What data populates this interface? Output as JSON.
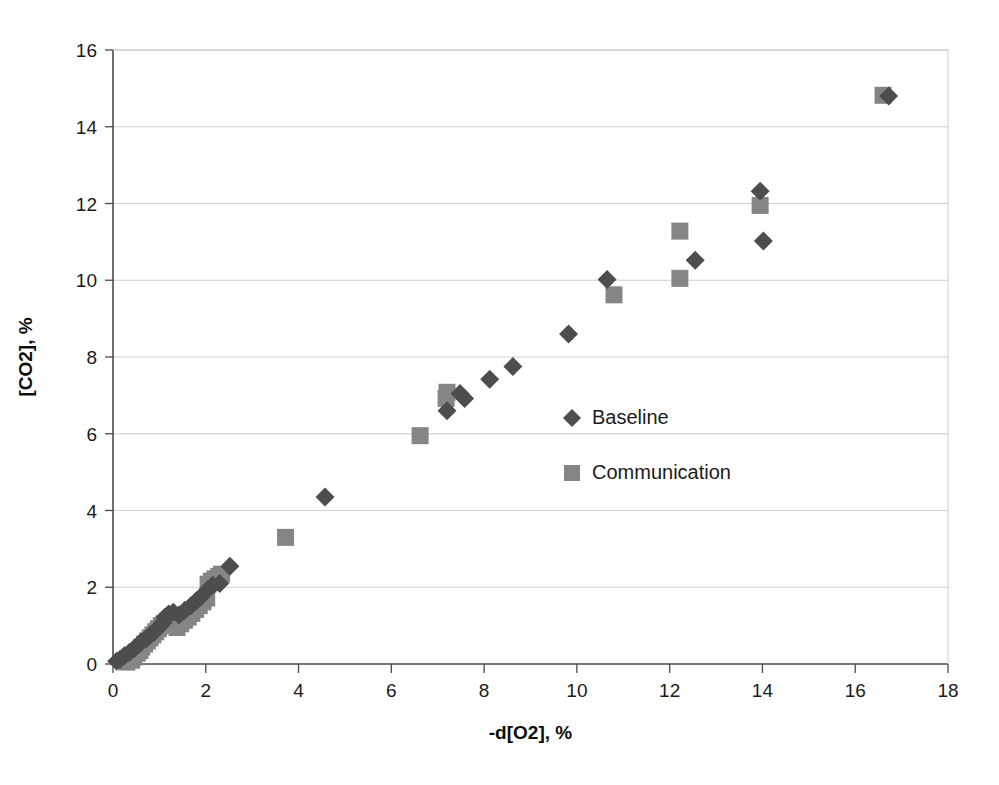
{
  "chart_data": {
    "type": "scatter",
    "title": "",
    "xlabel": "-d[O2], %",
    "ylabel": "[CO2], %",
    "xlim": [
      0,
      18
    ],
    "ylim": [
      0,
      16
    ],
    "xticks": [
      0,
      2,
      4,
      6,
      8,
      10,
      12,
      14,
      16,
      18
    ],
    "yticks": [
      0,
      2,
      4,
      6,
      8,
      10,
      12,
      14,
      16
    ],
    "grid": "horizontal",
    "legend_position": "inside-right",
    "colors": {
      "baseline": "#4d4d4d",
      "communication": "#858585",
      "axis": "#4a4a4a",
      "grid": "#c8c8c8",
      "background": "#ffffff"
    },
    "series": [
      {
        "name": "Baseline",
        "marker": "diamond",
        "color": "#4d4d4d",
        "points": [
          [
            0.08,
            0.07
          ],
          [
            0.15,
            0.12
          ],
          [
            0.25,
            0.22
          ],
          [
            0.35,
            0.3
          ],
          [
            0.45,
            0.4
          ],
          [
            0.55,
            0.5
          ],
          [
            0.62,
            0.58
          ],
          [
            0.72,
            0.66
          ],
          [
            0.8,
            0.75
          ],
          [
            0.88,
            0.82
          ],
          [
            0.95,
            0.92
          ],
          [
            1.02,
            1.0
          ],
          [
            1.08,
            1.08
          ],
          [
            1.12,
            1.22
          ],
          [
            1.2,
            1.3
          ],
          [
            1.3,
            1.35
          ],
          [
            1.42,
            1.28
          ],
          [
            1.55,
            1.4
          ],
          [
            1.68,
            1.52
          ],
          [
            1.8,
            1.65
          ],
          [
            1.9,
            1.76
          ],
          [
            2.05,
            1.95
          ],
          [
            2.15,
            2.05
          ],
          [
            2.3,
            2.1
          ],
          [
            2.52,
            2.55
          ],
          [
            4.57,
            4.35
          ],
          [
            7.2,
            6.6
          ],
          [
            7.58,
            6.92
          ],
          [
            7.48,
            7.05
          ],
          [
            8.12,
            7.42
          ],
          [
            8.62,
            7.75
          ],
          [
            9.82,
            8.6
          ],
          [
            10.65,
            10.02
          ],
          [
            12.55,
            10.52
          ],
          [
            13.95,
            12.32
          ],
          [
            14.02,
            11.02
          ],
          [
            16.72,
            14.8
          ]
        ]
      },
      {
        "name": "Communication",
        "marker": "square",
        "color": "#858585",
        "points": [
          [
            0.3,
            0.05
          ],
          [
            0.4,
            0.1
          ],
          [
            0.45,
            0.18
          ],
          [
            0.52,
            0.28
          ],
          [
            0.58,
            0.35
          ],
          [
            0.62,
            0.44
          ],
          [
            0.68,
            0.52
          ],
          [
            0.74,
            0.6
          ],
          [
            0.8,
            0.68
          ],
          [
            0.86,
            0.76
          ],
          [
            0.92,
            0.84
          ],
          [
            0.98,
            0.92
          ],
          [
            1.04,
            1.0
          ],
          [
            1.1,
            1.05
          ],
          [
            1.18,
            1.12
          ],
          [
            1.24,
            1.18
          ],
          [
            1.3,
            1.1
          ],
          [
            1.38,
            0.95
          ],
          [
            1.46,
            1.05
          ],
          [
            1.54,
            1.14
          ],
          [
            1.62,
            1.22
          ],
          [
            1.7,
            1.32
          ],
          [
            1.78,
            1.42
          ],
          [
            1.86,
            1.52
          ],
          [
            1.94,
            1.62
          ],
          [
            2.02,
            1.72
          ],
          [
            2.05,
            2.08
          ],
          [
            2.12,
            2.16
          ],
          [
            2.2,
            2.22
          ],
          [
            2.28,
            2.28
          ],
          [
            2.34,
            2.34
          ],
          [
            3.72,
            3.3
          ],
          [
            6.62,
            5.95
          ],
          [
            7.18,
            6.92
          ],
          [
            7.2,
            7.08
          ],
          [
            10.8,
            9.62
          ],
          [
            12.22,
            10.05
          ],
          [
            12.22,
            11.28
          ],
          [
            13.95,
            11.95
          ],
          [
            16.6,
            14.82
          ]
        ]
      }
    ]
  },
  "legend": {
    "items": [
      {
        "label": "Baseline",
        "marker": "diamond",
        "color": "#4d4d4d"
      },
      {
        "label": "Communication",
        "marker": "square",
        "color": "#858585"
      }
    ]
  },
  "axes": {
    "x_title": "-d[O2], %",
    "y_title": "[CO2], %",
    "x_tick_labels": [
      "0",
      "2",
      "4",
      "6",
      "8",
      "10",
      "12",
      "14",
      "16",
      "18"
    ],
    "y_tick_labels": [
      "0",
      "2",
      "4",
      "6",
      "8",
      "10",
      "12",
      "14",
      "16"
    ]
  }
}
